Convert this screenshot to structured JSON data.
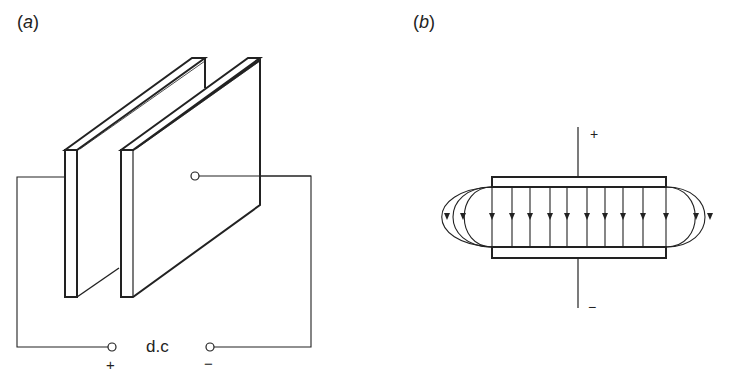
{
  "panel_a": {
    "label": "(a)",
    "label_letter": "a",
    "supply_label": "d.c",
    "plus_sign": "+",
    "minus_sign": "−"
  },
  "panel_b": {
    "label": "(b)",
    "label_letter": "b",
    "plus_sign": "+",
    "minus_sign": "−",
    "field_line_count": 10
  },
  "colors": {
    "stroke": "#222222",
    "background": "#ffffff"
  }
}
